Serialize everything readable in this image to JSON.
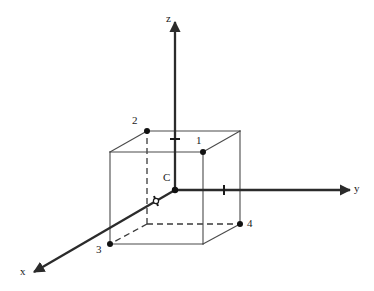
{
  "figure": {
    "type": "3d-coordinate-cube-diagram",
    "background_color": "#ffffff",
    "line_color": "#3a3a3a",
    "axis_color": "#2b2b2b",
    "marker_color": "#111111",
    "label_color": "#1a1a1a"
  },
  "axes": [
    {
      "id": "z",
      "label": "z",
      "label_x": 166,
      "label_y": 13,
      "from_x": 175,
      "from_y": 190,
      "to_x": 175,
      "to_y": 22,
      "arrow": true,
      "tick_x": 175,
      "tick_y": 139
    },
    {
      "id": "y",
      "label": "y",
      "label_x": 354,
      "label_y": 183,
      "from_x": 175,
      "from_y": 190,
      "to_x": 350,
      "to_y": 190,
      "arrow": true,
      "tick_x": 224,
      "tick_y": 190
    },
    {
      "id": "x",
      "label": "x",
      "label_x": 20,
      "label_y": 266,
      "from_x": 175,
      "from_y": 190,
      "to_x": 34,
      "to_y": 272,
      "arrow": true,
      "tick_x": 156,
      "tick_y": 201
    }
  ],
  "origin": {
    "id": "C",
    "label": "C",
    "x": 175,
    "y": 190,
    "label_x": 163,
    "label_y": 172,
    "marker": true
  },
  "cube": {
    "vertices": {
      "front_top_left": {
        "x": 110,
        "y": 152
      },
      "front_top_right": {
        "x": 203,
        "y": 152
      },
      "front_bottom_left": {
        "x": 110,
        "y": 244
      },
      "front_bottom_right": {
        "x": 203,
        "y": 244
      },
      "back_top_left": {
        "x": 147,
        "y": 131
      },
      "back_top_right": {
        "x": 240,
        "y": 131
      },
      "back_bottom_left": {
        "x": 147,
        "y": 224
      },
      "back_bottom_right": {
        "x": 240,
        "y": 224
      }
    },
    "solid_edges": [
      [
        "front_top_left",
        "front_top_right"
      ],
      [
        "front_top_right",
        "front_bottom_right"
      ],
      [
        "front_bottom_right",
        "front_bottom_left"
      ],
      [
        "front_bottom_left",
        "front_top_left"
      ],
      [
        "back_top_left",
        "back_top_right"
      ],
      [
        "back_top_right",
        "back_bottom_right"
      ],
      [
        "front_top_left",
        "back_top_left"
      ],
      [
        "front_top_right",
        "back_top_right"
      ],
      [
        "front_bottom_right",
        "back_bottom_right"
      ]
    ],
    "dashed_edges": [
      [
        "back_bottom_left",
        "back_top_left"
      ],
      [
        "back_bottom_left",
        "back_bottom_right"
      ],
      [
        "back_bottom_left",
        "front_bottom_left"
      ]
    ]
  },
  "vertex_labels": [
    {
      "id": "1",
      "text": "1",
      "point_x": 203,
      "point_y": 152,
      "label_x": 196,
      "label_y": 135,
      "marker": true
    },
    {
      "id": "2",
      "text": "2",
      "point_x": 147,
      "point_y": 131,
      "label_x": 132,
      "label_y": 115,
      "marker": true
    },
    {
      "id": "3",
      "text": "3",
      "point_x": 110,
      "point_y": 244,
      "label_x": 96,
      "label_y": 244,
      "marker": true
    },
    {
      "id": "4",
      "text": "4",
      "point_x": 240,
      "point_y": 224,
      "label_x": 247,
      "label_y": 218,
      "marker": true
    }
  ],
  "ticks": [
    {
      "axis": "z",
      "x": 175,
      "y": 139
    },
    {
      "axis": "y",
      "x": 224,
      "y": 190
    },
    {
      "axis": "x",
      "x": 156,
      "y": 201
    }
  ]
}
